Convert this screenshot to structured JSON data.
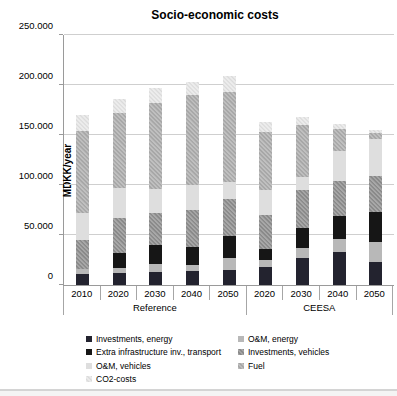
{
  "figure": {
    "title": "Socio-economic costs",
    "y_axis_title": "MDKK/year"
  },
  "chart_data": {
    "type": "bar",
    "subtype": "stacked",
    "title": "Socio-economic costs",
    "ylabel": "MDKK/year",
    "xlabel": "",
    "ylim": [
      0,
      250000
    ],
    "grid": true,
    "legend_position": "bottom",
    "y_ticks": [
      {
        "value": 0,
        "label": "0"
      },
      {
        "value": 50000,
        "label": "50.000"
      },
      {
        "value": 100000,
        "label": "100.000"
      },
      {
        "value": 150000,
        "label": "150.000"
      },
      {
        "value": 200000,
        "label": "200.000"
      },
      {
        "value": 250000,
        "label": "250.000"
      }
    ],
    "groups": [
      {
        "label": "Reference",
        "span": 5
      },
      {
        "label": "CEESA",
        "span": 4
      }
    ],
    "categories": [
      "2010",
      "2020",
      "2030",
      "2040",
      "2050",
      "2020",
      "2030",
      "2040",
      "2050"
    ],
    "series": [
      {
        "name": "Investments, energy",
        "color": "#23232f",
        "hatch": false,
        "values": [
          11000,
          12000,
          13000,
          14000,
          15000,
          18000,
          27000,
          33000,
          23000
        ]
      },
      {
        "name": "O&M, energy",
        "color": "#b8b8b8",
        "hatch": false,
        "values": [
          5000,
          5000,
          8000,
          6000,
          12000,
          7000,
          10000,
          13000,
          20000
        ]
      },
      {
        "name": "Extra infrastructure inv., transport",
        "color": "#161616",
        "hatch": false,
        "values": [
          0,
          15000,
          19000,
          18000,
          22000,
          11000,
          20000,
          23000,
          30000
        ]
      },
      {
        "name": "Investments, vehicles",
        "color": "#8f8f8f",
        "hatch": true,
        "values": [
          29000,
          35000,
          32000,
          37000,
          37000,
          34000,
          38000,
          35000,
          36000
        ]
      },
      {
        "name": "O&M, vehicles",
        "color": "#dedede",
        "hatch": false,
        "values": [
          27000,
          30000,
          24000,
          25000,
          17000,
          25000,
          13000,
          30000,
          37000
        ]
      },
      {
        "name": "Fuel",
        "color": "#aeaeae",
        "hatch": true,
        "values": [
          82000,
          75000,
          86000,
          90000,
          90000,
          58000,
          52000,
          22000,
          6000
        ]
      },
      {
        "name": "CO2-costs",
        "color": "#e7e7e7",
        "hatch": true,
        "values": [
          16000,
          14000,
          15000,
          13000,
          16000,
          10000,
          8000,
          5000,
          3000
        ]
      }
    ]
  }
}
